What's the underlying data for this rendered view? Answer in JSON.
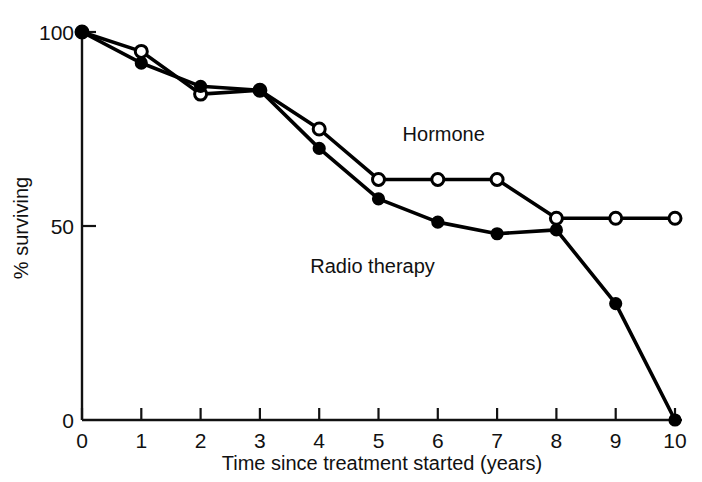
{
  "chart_data": {
    "type": "line",
    "title": "",
    "xlabel": "Time since treatment started (years)",
    "ylabel": "% surviving",
    "x": [
      0,
      1,
      2,
      3,
      4,
      5,
      6,
      7,
      8,
      9,
      10
    ],
    "xlim": [
      0,
      10
    ],
    "ylim": [
      0,
      100
    ],
    "xticks": [
      "0",
      "1",
      "2",
      "3",
      "4",
      "5",
      "6",
      "7",
      "8",
      "9",
      "10"
    ],
    "yticks": [
      "0",
      "50",
      "100"
    ],
    "ytick_values": [
      0,
      50,
      100
    ],
    "grid": false,
    "legend": "inline-annotations",
    "series": [
      {
        "name": "Hormone",
        "marker": "open-circle",
        "color": "#000000",
        "x": [
          0,
          1,
          2,
          3,
          4,
          5,
          6,
          7,
          8,
          9,
          10
        ],
        "values": [
          100,
          95,
          84,
          85,
          75,
          62,
          62,
          62,
          52,
          52,
          52
        ],
        "label_x": 6.1,
        "label_y": 72
      },
      {
        "name": "Radio therapy",
        "marker": "filled-circle",
        "color": "#000000",
        "x": [
          0,
          1,
          2,
          3,
          4,
          5,
          6,
          7,
          8,
          9,
          10
        ],
        "values": [
          100,
          92,
          86,
          85,
          70,
          57,
          51,
          48,
          49,
          30,
          0
        ],
        "label_x": 4.9,
        "label_y": 38
      }
    ],
    "annotations": [
      {
        "text": "Hormone",
        "series": "Hormone"
      },
      {
        "text": "Radio therapy",
        "series": "Radio therapy"
      }
    ]
  },
  "axes": {
    "x_axis_name": "time-axis",
    "y_axis_name": "survival-axis"
  }
}
